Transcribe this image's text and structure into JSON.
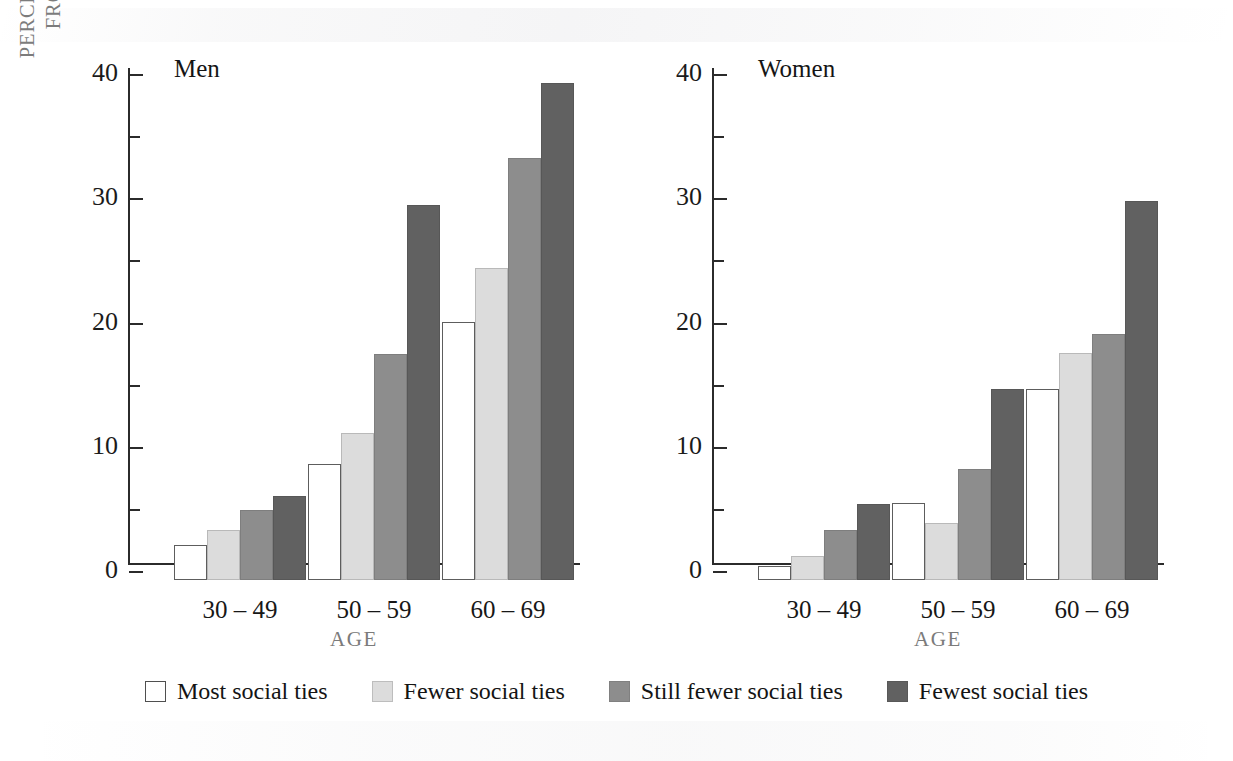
{
  "chart_data": {
    "type": "bar",
    "title": "",
    "xlabel": "AGE",
    "ylabel": "PERCENTAGE WHO DIED\nFROM ALL CAUSES",
    "ylim": [
      0,
      40
    ],
    "ytick_labels": [
      "0",
      "10",
      "20",
      "30",
      "40"
    ],
    "ytick_values": [
      0,
      10,
      20,
      30,
      40
    ],
    "yminor_values": [
      5,
      15,
      25,
      35
    ],
    "grid": false,
    "legend_position": "bottom",
    "categories": [
      "30 – 49",
      "50 – 59",
      "60 – 69"
    ],
    "panels": [
      {
        "name": "Men",
        "series": [
          {
            "name": "Most social ties",
            "values": [
              2.8,
              9.3,
              20.8
            ]
          },
          {
            "name": "Fewer social ties",
            "values": [
              4.0,
              11.8,
              25.1
            ]
          },
          {
            "name": "Still fewer social ties",
            "values": [
              5.6,
              18.2,
              34.0
            ]
          },
          {
            "name": "Fewest social ties",
            "values": [
              6.8,
              30.2,
              40.0
            ]
          }
        ]
      },
      {
        "name": "Women",
        "series": [
          {
            "name": "Most social ties",
            "values": [
              1.1,
              6.2,
              15.4
            ]
          },
          {
            "name": "Fewer social ties",
            "values": [
              1.9,
              4.6,
              18.3
            ]
          },
          {
            "name": "Still fewer social ties",
            "values": [
              4.0,
              8.9,
              19.8
            ]
          },
          {
            "name": "Fewest social ties",
            "values": [
              6.1,
              15.4,
              30.5
            ]
          }
        ]
      }
    ],
    "legend": [
      {
        "label": "Most social ties",
        "color": "#ffffff"
      },
      {
        "label": "Fewer social ties",
        "color": "#dcdcdc"
      },
      {
        "label": "Still fewer social ties",
        "color": "#8d8d8d"
      },
      {
        "label": "Fewest social ties",
        "color": "#616161"
      }
    ]
  },
  "colors": {
    "axis": "#2b2b2b",
    "axis_text": "#1b1b1b",
    "axis_title": "#7c7c7c",
    "background": "#ffffff"
  }
}
